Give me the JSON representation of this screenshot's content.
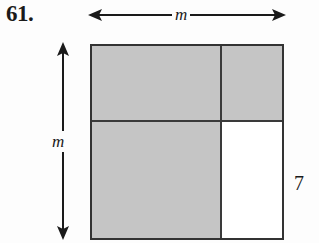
{
  "figure": {
    "problem_number": "61.",
    "width_label": "m",
    "height_label": "m",
    "right_side_label": "7",
    "colors": {
      "shaded": "#c5c5c5",
      "unshaded": "#ffffff",
      "stroke": "#333333",
      "text": "#1a1a1a"
    },
    "square": {
      "regions": [
        {
          "name": "top-left",
          "shaded": "yes"
        },
        {
          "name": "top-right",
          "shaded": "yes"
        },
        {
          "name": "bottom-left",
          "shaded": "yes"
        },
        {
          "name": "bottom-right",
          "shaded": "no"
        }
      ]
    },
    "arrows": {
      "width_arrow": "double-headed-horizontal",
      "height_arrow": "double-headed-vertical"
    }
  }
}
